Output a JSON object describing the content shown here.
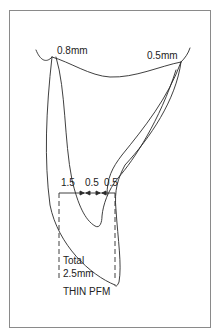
{
  "diagram": {
    "title": "THIN PFM",
    "labels": {
      "left_margin": "0.8mm",
      "right_margin": "0.5mm",
      "dim_1": "1.5",
      "dim_2": "0.5",
      "dim_3": "0.5",
      "total_line1": "Total",
      "total_line2": "2.5mm",
      "caption": "THIN PFM"
    },
    "colors": {
      "stroke": "#2a2a2a",
      "frame": "#8a8a8a",
      "background": "#ffffff"
    }
  }
}
